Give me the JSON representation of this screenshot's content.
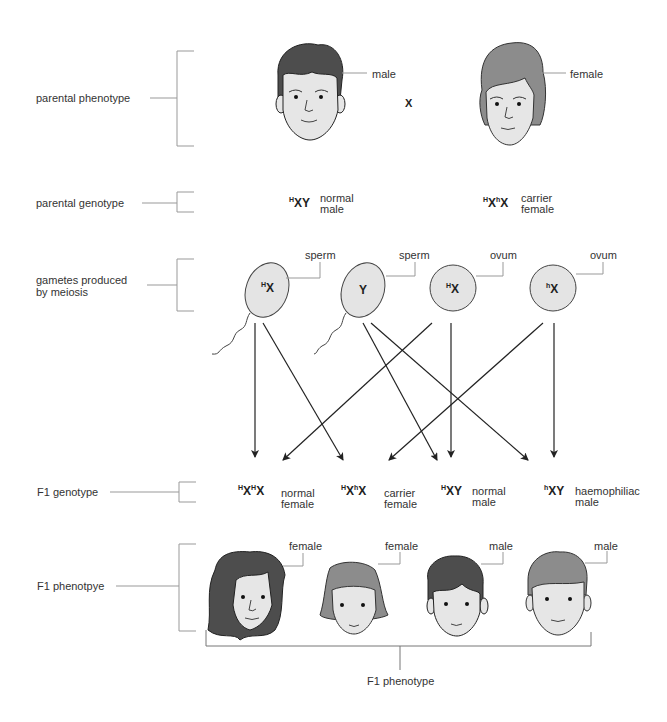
{
  "rows": {
    "parental_phenotype": "parental phenotype",
    "parental_genotype": "parental genotype",
    "gametes": "gametes produced\nby meiosis",
    "f1_genotype": "F1 genotype",
    "f1_phenotype_left": "F1 phenotpye",
    "f1_phenotype_bottom": "F1 phenotype"
  },
  "parents": {
    "male_label": "male",
    "female_label": "female",
    "cross_symbol": "X",
    "male_genotype": {
      "allele": "H",
      "chrom": "XY",
      "desc": "normal\nmale"
    },
    "female_genotype": {
      "allele1": "H",
      "chrom1": "X",
      "allele2": "h",
      "chrom2": "X",
      "desc": "carrier\nfemale"
    }
  },
  "gametes": [
    {
      "type": "sperm",
      "label": "sperm",
      "allele": "H",
      "chrom": "X"
    },
    {
      "type": "sperm",
      "label": "sperm",
      "allele": "",
      "chrom": "Y"
    },
    {
      "type": "ovum",
      "label": "ovum",
      "allele": "H",
      "chrom": "X"
    },
    {
      "type": "ovum",
      "label": "ovum",
      "allele": "h",
      "chrom": "X"
    }
  ],
  "f1": [
    {
      "a1": "H",
      "c1": "X",
      "a2": "H",
      "c2": "X",
      "desc": "normal\nfemale",
      "sex": "female",
      "hair": "#4a4a4a"
    },
    {
      "a1": "H",
      "c1": "X",
      "a2": "h",
      "c2": "X",
      "desc": "carrier\nfemale",
      "sex": "female",
      "hair": "#8a8a8a"
    },
    {
      "a1": "H",
      "c1": "XY",
      "a2": "",
      "c2": "",
      "desc": "normal\nmale",
      "sex": "male",
      "hair": "#4a4a4a"
    },
    {
      "a1": "h",
      "c1": "XY",
      "a2": "",
      "c2": "",
      "desc": "haemophiliac\nmale",
      "sex": "male",
      "hair": "#8a8a8a"
    }
  ],
  "colors": {
    "line": "#999999",
    "arrow": "#222222",
    "skin": "#e6e6e6",
    "gamete_fill": "#e4e4e4",
    "dark_hair": "#4d4d4d",
    "light_hair": "#8c8c8c"
  }
}
